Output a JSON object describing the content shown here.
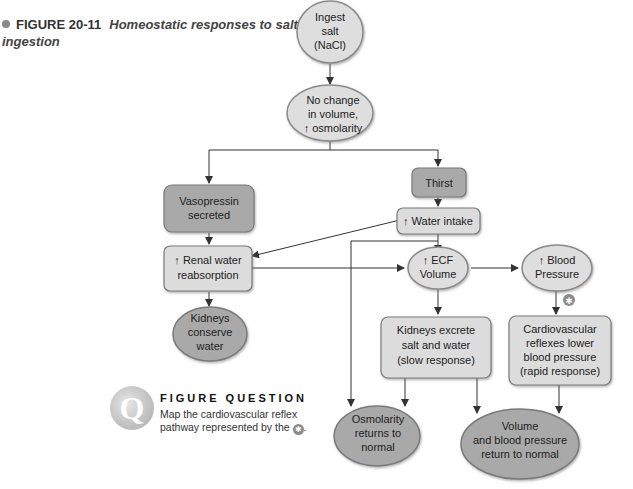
{
  "caption": {
    "figure_number": "FIGURE 20-11",
    "title": "Homeostatic responses to salt ingestion"
  },
  "nodes": {
    "ingest": [
      "Ingest",
      "salt",
      "(NaCl)"
    ],
    "nochange": [
      "No change",
      "in volume,",
      "↑ osmolarity"
    ],
    "vasopressin": [
      "Vasopressin",
      "secreted"
    ],
    "thirst": [
      "Thirst"
    ],
    "water_intake": [
      "↑ Water intake"
    ],
    "renal": [
      "↑ Renal water",
      "reabsorption"
    ],
    "ecf": [
      "↑ ECF",
      "Volume"
    ],
    "bp": [
      "↑ Blood",
      "Pressure"
    ],
    "kidneys_conserve": [
      "Kidneys",
      "conserve",
      "water"
    ],
    "kidneys_excrete": [
      "Kidneys excrete",
      "salt and water",
      "(slow response)"
    ],
    "cardio": [
      "Cardiovascular",
      "reflexes lower",
      "blood pressure",
      "(rapid response)"
    ],
    "osmolarity_normal": [
      "Osmolarity",
      "returns to",
      "normal"
    ],
    "volume_normal": [
      "Volume",
      "and blood pressure",
      "return to normal"
    ]
  },
  "marker": {
    "symbol": "✱"
  },
  "figure_question": {
    "icon_letter": "Q",
    "title": "FIGURE QUESTION",
    "body": "Map the cardiovascular reflex pathway represented by the",
    "suffix": "."
  },
  "colors": {
    "light_fill": "#dcdcdc",
    "dark_fill": "#a9a9a9",
    "stroke": "#7a7a7a",
    "arrow": "#333333"
  }
}
